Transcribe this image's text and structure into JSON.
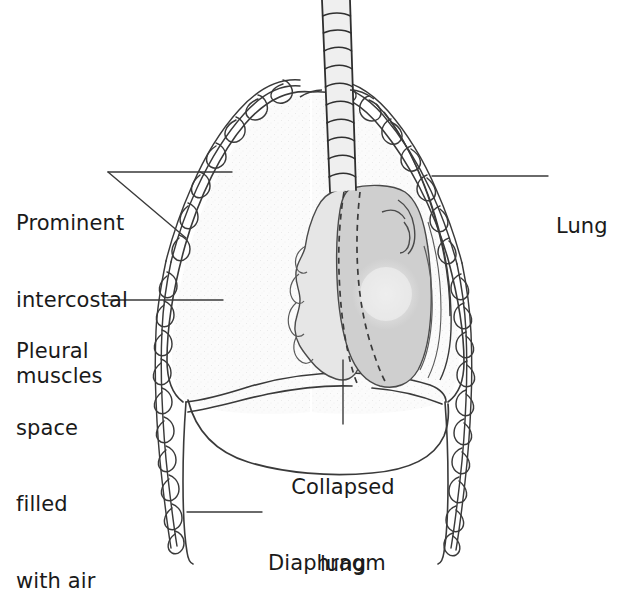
{
  "figure": {
    "type": "anatomical-line-illustration",
    "width": 620,
    "height": 594,
    "background_color": "#ffffff"
  },
  "labels": {
    "intercostal": {
      "name": "prominent-intercostal-muscles",
      "lines": [
        "Prominent",
        "intercostal",
        "muscles"
      ],
      "text": "Prominent intercostal muscles",
      "position": "left",
      "leader": "forked-two-lines"
    },
    "pleural": {
      "name": "pleural-space-filled-with-air",
      "lines": [
        "Pleural",
        "space",
        "filled",
        "with air"
      ],
      "text": "Pleural space filled with air",
      "position": "left",
      "leader": "horizontal"
    },
    "lung": {
      "name": "lung",
      "lines": [
        "Lung"
      ],
      "text": "Lung",
      "position": "right",
      "leader": "horizontal"
    },
    "collapsed": {
      "name": "collapsed-lung",
      "lines": [
        "Collapsed",
        "lung"
      ],
      "text": "Collapsed lung",
      "position": "bottom-center",
      "leader": "vertical"
    },
    "diaphragm": {
      "name": "diaphragm",
      "lines": [
        "Diaphragm"
      ],
      "text": "Diaphragm",
      "position": "bottom-right",
      "leader": "horizontal"
    }
  },
  "anatomy": {
    "trachea": {
      "name": "trachea",
      "cartilage_rings": 10,
      "fill_color": "#efefef"
    },
    "pleural_space": {
      "name": "pleural-space",
      "fill_color": "#f9f9f9",
      "stipple": true
    },
    "mediastinum_heart": {
      "name": "heart-mediastinum",
      "fill_color": "#cfcfcf"
    },
    "collapsed_lung": {
      "name": "collapsed-lung-shape",
      "fill_color": "#e3e3e3",
      "lobulated": true
    },
    "chest_wall": {
      "name": "intercostal-chest-wall",
      "style": "wavy-braided-double-line"
    },
    "diaphragm_dome": {
      "name": "diaphragm-dome",
      "style": "smooth-arc"
    }
  },
  "colors": {
    "ink": "#2b2b2b",
    "leader": "#3a3a3a",
    "heart_gray": "#cfcfcf",
    "lung_gray": "#e3e3e3",
    "trachea_gray": "#efefef",
    "pleura_white": "#f9f9f9"
  }
}
